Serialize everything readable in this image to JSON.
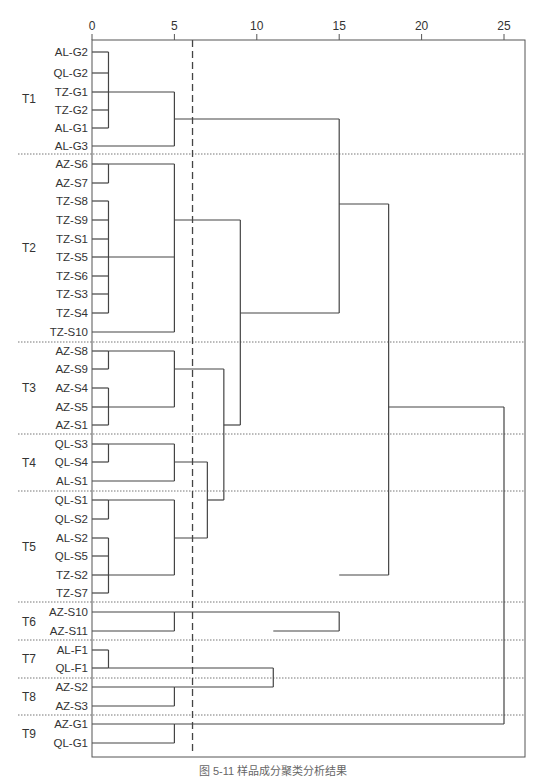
{
  "chart_data": {
    "type": "dendrogram",
    "title": "",
    "xlabel": "",
    "ylabel": "",
    "x_axis": {
      "position": "top",
      "ticks": [
        0,
        5,
        10,
        15,
        20,
        25
      ],
      "range": [
        0,
        26.3
      ]
    },
    "cut_line": {
      "value": 6.1,
      "style": "dashed"
    },
    "grid": false,
    "groups": [
      {
        "name": "T1",
        "leaves": [
          "AL-G2",
          "QL-G2",
          "TZ-G1",
          "TZ-G2",
          "AL-G1",
          "AL-G3"
        ]
      },
      {
        "name": "T2",
        "leaves": [
          "AZ-S6",
          "AZ-S7",
          "TZ-S8",
          "TZ-S9",
          "TZ-S1",
          "TZ-S5",
          "TZ-S6",
          "TZ-S3",
          "TZ-S4",
          "TZ-S10"
        ]
      },
      {
        "name": "T3",
        "leaves": [
          "AZ-S8",
          "AZ-S9",
          "AZ-S4",
          "AZ-S5",
          "AZ-S1"
        ]
      },
      {
        "name": "T4",
        "leaves": [
          "QL-S3",
          "QL-S4",
          "AL-S1"
        ]
      },
      {
        "name": "T5",
        "leaves": [
          "QL-S1",
          "QL-S2",
          "AL-S2",
          "QL-S5",
          "TZ-S2",
          "TZ-S7"
        ]
      },
      {
        "name": "T6",
        "leaves": [
          "AZ-S10",
          "AZ-S11"
        ]
      },
      {
        "name": "T7",
        "leaves": [
          "AL-F1",
          "QL-F1"
        ]
      },
      {
        "name": "T8",
        "leaves": [
          "AZ-S2",
          "AZ-S3"
        ]
      },
      {
        "name": "T9",
        "leaves": [
          "AZ-G1",
          "QL-G1"
        ]
      }
    ],
    "merges": [
      {
        "members": [
          "AL-G2",
          "QL-G2",
          "TZ-G1",
          "TZ-G2",
          "AL-G1"
        ],
        "distance": 1
      },
      {
        "members": [
          "T1a",
          "AL-G3"
        ],
        "distance": 5,
        "result": "T1"
      },
      {
        "members": [
          "AZ-S6",
          "AZ-S7"
        ],
        "distance": 1
      },
      {
        "members": [
          "TZ-S8",
          "TZ-S9",
          "TZ-S1",
          "TZ-S5",
          "TZ-S6",
          "TZ-S3",
          "TZ-S4"
        ],
        "distance": 1
      },
      {
        "members": [
          "AZ-S6/S7",
          "TZ-S8..S4",
          "TZ-S10"
        ],
        "distance": 5,
        "result": "T2"
      },
      {
        "members": [
          "AZ-S8",
          "AZ-S9"
        ],
        "distance": 1
      },
      {
        "members": [
          "AZ-S4",
          "AZ-S5",
          "AZ-S1"
        ],
        "distance": 1
      },
      {
        "members": [
          "AZ-S8/S9",
          "AZ-S4/S5/S1"
        ],
        "distance": 5,
        "result": "T3"
      },
      {
        "members": [
          "QL-S3",
          "QL-S4"
        ],
        "distance": 1
      },
      {
        "members": [
          "QL-S3/S4",
          "AL-S1"
        ],
        "distance": 5,
        "result": "T4"
      },
      {
        "members": [
          "QL-S1",
          "QL-S2"
        ],
        "distance": 1
      },
      {
        "members": [
          "AL-S2",
          "QL-S5",
          "TZ-S2",
          "TZ-S7"
        ],
        "distance": 1
      },
      {
        "members": [
          "QL-S1/S2",
          "AL-S2..TZ-S7"
        ],
        "distance": 5,
        "result": "T5"
      },
      {
        "members": [
          "T4",
          "T5"
        ],
        "distance": 7
      },
      {
        "members": [
          "T3",
          "T4+T5"
        ],
        "distance": 8
      },
      {
        "members": [
          "T2",
          "T3+T4+T5"
        ],
        "distance": 9
      },
      {
        "members": [
          "T1",
          "T2..T5"
        ],
        "distance": 15
      },
      {
        "members": [
          "AZ-S10",
          "AZ-S11"
        ],
        "distance": 5,
        "result": "T6"
      },
      {
        "members": [
          "AL-F1",
          "QL-F1"
        ],
        "distance": 1,
        "result": "T7"
      },
      {
        "members": [
          "AZ-S2",
          "AZ-S3"
        ],
        "distance": 5,
        "result": "T8"
      },
      {
        "members": [
          "T7",
          "T8"
        ],
        "distance": 11
      },
      {
        "members": [
          "T6",
          "T7+T8"
        ],
        "distance": 15
      },
      {
        "members": [
          "T1..T5",
          "T6..T8"
        ],
        "distance": 18
      },
      {
        "members": [
          "AZ-G1",
          "QL-G1"
        ],
        "distance": 5,
        "result": "T9"
      },
      {
        "members": [
          "T1..T8",
          "T9"
        ],
        "distance": 25
      }
    ]
  },
  "caption": "图 5-11  样品成分聚类分析结果"
}
